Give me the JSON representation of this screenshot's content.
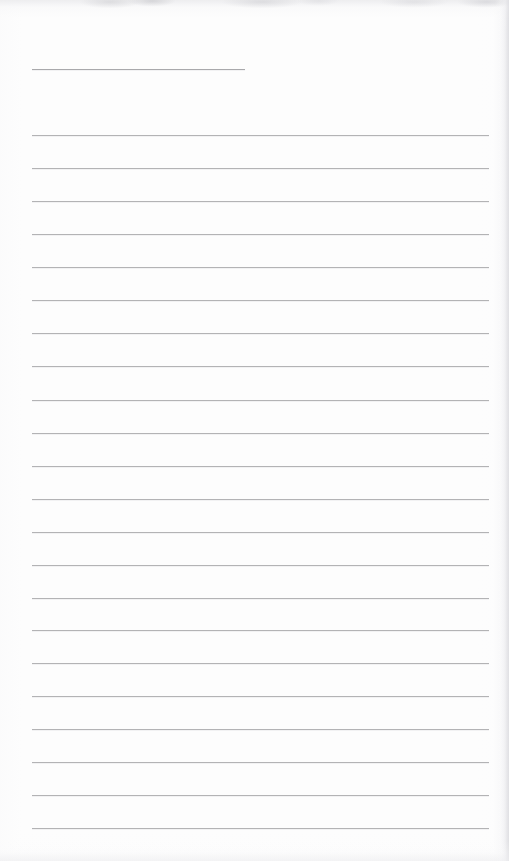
{
  "document": {
    "kind": "blank-lined-page",
    "title_text": "",
    "body_text": "",
    "page_width": 509,
    "page_height": 861,
    "background_color": "#fdfdfd",
    "rule_color": "#b3b3b5",
    "rule_thickness_px": 1,
    "rule_left_x": 32,
    "rule_right_x": 489,
    "rule_spacing_px": 33.05,
    "visible_text_count": 0,
    "notes_visible": "no text, handwriting, headers, page numbers or marks are present"
  },
  "scan_artifacts": {
    "top_edge_smudge_color": "#c4c4c8",
    "right_edge_shadow_color": "#dedee2",
    "bottom_edge_shadow_color": "#f0f0f2"
  },
  "title_rule": {
    "label": "title-blank-line",
    "x": 32,
    "y": 69,
    "width": 213
  },
  "body_rules": [
    {
      "y": 135,
      "x": 32,
      "width": 457
    },
    {
      "y": 168,
      "x": 32,
      "width": 457
    },
    {
      "y": 201,
      "x": 32,
      "width": 457
    },
    {
      "y": 234,
      "x": 32,
      "width": 457
    },
    {
      "y": 267,
      "x": 32,
      "width": 457
    },
    {
      "y": 300,
      "x": 32,
      "width": 457
    },
    {
      "y": 333,
      "x": 32,
      "width": 457
    },
    {
      "y": 366,
      "x": 32,
      "width": 457
    },
    {
      "y": 400,
      "x": 32,
      "width": 457
    },
    {
      "y": 433,
      "x": 32,
      "width": 457
    },
    {
      "y": 466,
      "x": 32,
      "width": 457
    },
    {
      "y": 499,
      "x": 32,
      "width": 457
    },
    {
      "y": 532,
      "x": 32,
      "width": 457
    },
    {
      "y": 565,
      "x": 32,
      "width": 457
    },
    {
      "y": 598,
      "x": 32,
      "width": 457
    },
    {
      "y": 630,
      "x": 32,
      "width": 457
    },
    {
      "y": 663,
      "x": 32,
      "width": 457
    },
    {
      "y": 696,
      "x": 32,
      "width": 457
    },
    {
      "y": 729,
      "x": 32,
      "width": 457
    },
    {
      "y": 762,
      "x": 32,
      "width": 457
    },
    {
      "y": 795,
      "x": 32,
      "width": 457
    },
    {
      "y": 828,
      "x": 32,
      "width": 457
    }
  ]
}
